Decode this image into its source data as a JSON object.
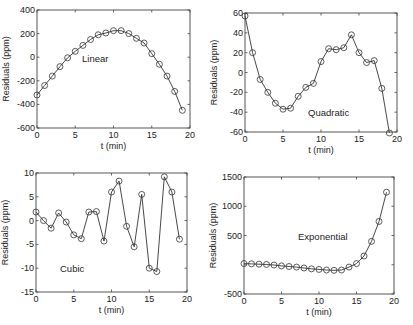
{
  "chart_data": [
    {
      "type": "line",
      "title": "",
      "annotation": "Linear",
      "xlabel": "t (min)",
      "ylabel": "Residuals (ppm)",
      "xlim": [
        0,
        20
      ],
      "ylim": [
        -600,
        400
      ],
      "xticks": [
        0,
        5,
        10,
        15,
        20
      ],
      "yticks": [
        -600,
        -400,
        -200,
        0,
        200,
        400
      ],
      "grid": false,
      "marker": "circle",
      "x": [
        0,
        1,
        2,
        3,
        4,
        5,
        6,
        7,
        8,
        9,
        10,
        11,
        12,
        13,
        14,
        15,
        16,
        17,
        18,
        19
      ],
      "values": [
        -320,
        -240,
        -160,
        -80,
        -5,
        50,
        100,
        150,
        190,
        205,
        225,
        225,
        200,
        160,
        120,
        30,
        -60,
        -160,
        -290,
        -450
      ]
    },
    {
      "type": "line",
      "title": "",
      "annotation": "Quadratic",
      "xlabel": "t (min)",
      "ylabel": "Residuals (ppm)",
      "xlim": [
        0,
        20
      ],
      "ylim": [
        -60,
        60
      ],
      "xticks": [
        0,
        5,
        10,
        15,
        20
      ],
      "yticks": [
        -60,
        -40,
        -20,
        0,
        20,
        40,
        60
      ],
      "grid": false,
      "marker": "circle",
      "x": [
        0,
        1,
        2,
        3,
        4,
        5,
        6,
        7,
        8,
        9,
        10,
        11,
        12,
        13,
        14,
        15,
        16,
        17,
        18,
        19
      ],
      "values": [
        57,
        20,
        -7,
        -20,
        -31,
        -37,
        -36,
        -24,
        -15,
        -11,
        11,
        24,
        23,
        25,
        38,
        20,
        10,
        12,
        -16,
        -61
      ]
    },
    {
      "type": "line",
      "title": "",
      "annotation": "Cubic",
      "xlabel": "t (min)",
      "ylabel": "Residuals (ppm)",
      "xlim": [
        0,
        20
      ],
      "ylim": [
        -15,
        10
      ],
      "xticks": [
        0,
        5,
        10,
        15,
        20
      ],
      "yticks": [
        -15,
        -10,
        -5,
        0,
        5,
        10
      ],
      "grid": false,
      "marker": "circle",
      "x": [
        0,
        1,
        2,
        3,
        4,
        5,
        6,
        7,
        8,
        9,
        10,
        11,
        12,
        13,
        14,
        15,
        16,
        17,
        18,
        19
      ],
      "values": [
        1.8,
        0,
        -1.6,
        1.6,
        -0.3,
        -3,
        -3.8,
        1.8,
        1.9,
        -4.3,
        6,
        8.3,
        -1.2,
        -5.5,
        5.5,
        -10,
        -10.7,
        9.2,
        6,
        -3.9
      ]
    },
    {
      "type": "line",
      "title": "",
      "annotation": "Exponential",
      "xlabel": "t (min)",
      "ylabel": "Residuals (ppm)",
      "xlim": [
        0,
        20
      ],
      "ylim": [
        -500,
        1500
      ],
      "xticks": [
        0,
        5,
        10,
        15,
        20
      ],
      "yticks": [
        -500,
        0,
        500,
        1000,
        1500
      ],
      "ytick_labels": [
        "-500",
        "",
        "500",
        "1000",
        "1500"
      ],
      "grid": false,
      "marker": "circle",
      "x": [
        0,
        1,
        2,
        3,
        4,
        5,
        6,
        7,
        8,
        9,
        10,
        11,
        12,
        13,
        14,
        15,
        16,
        17,
        18,
        19
      ],
      "values": [
        20,
        15,
        10,
        5,
        -5,
        -20,
        -30,
        -40,
        -55,
        -70,
        -80,
        -90,
        -95,
        -90,
        -40,
        20,
        150,
        400,
        740,
        1240
      ]
    }
  ],
  "panels": [
    {
      "id": "linear",
      "frame": {
        "x0": 37,
        "x1": 190,
        "y0": 10,
        "y1": 128
      },
      "ann_pos": [
        82,
        62
      ]
    },
    {
      "id": "quadratic",
      "frame": {
        "x0": 245,
        "x1": 397,
        "y0": 13,
        "y1": 132
      },
      "ann_pos": [
        308,
        116
      ]
    },
    {
      "id": "cubic",
      "frame": {
        "x0": 36,
        "x1": 187,
        "y0": 173,
        "y1": 292
      },
      "ann_pos": [
        60,
        272
      ]
    },
    {
      "id": "exponential",
      "frame": {
        "x0": 244,
        "x1": 394,
        "y0": 177,
        "y1": 294
      },
      "ann_pos": [
        298,
        240
      ]
    }
  ],
  "style": {
    "line_color": "#333333",
    "marker_edge": "#333333",
    "axis_color": "#444444",
    "background": "#ffffff"
  }
}
